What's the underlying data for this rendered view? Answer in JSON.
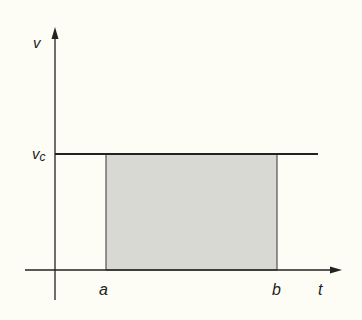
{
  "diagram": {
    "y_axis_label": "v",
    "level_label_main": "v",
    "level_label_sub": "c",
    "x_axis_label": "t",
    "left_bound_label": "a",
    "right_bound_label": "b",
    "colors": {
      "background": "#fdfdf6",
      "line": "#222222",
      "shade": "#d9d9d4"
    }
  }
}
